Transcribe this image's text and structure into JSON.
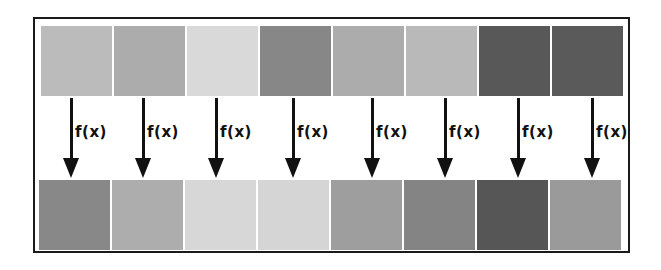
{
  "diagram": {
    "function_label": "f(x)",
    "input_squares": [
      {
        "index": 1,
        "color": "#c4c4c4"
      },
      {
        "index": 2,
        "color": "#b5b5b5"
      },
      {
        "index": 3,
        "color": "#e4e4e4"
      },
      {
        "index": 4,
        "color": "#8e8e8e"
      },
      {
        "index": 5,
        "color": "#b4b4b4"
      },
      {
        "index": 6,
        "color": "#c2c2c2"
      },
      {
        "index": 7,
        "color": "#5c5c5c"
      },
      {
        "index": 8,
        "color": "#5e5e5e"
      }
    ],
    "arrows": [
      {
        "index": 1,
        "label": "f(x)"
      },
      {
        "index": 2,
        "label": "f(x)"
      },
      {
        "index": 3,
        "label": "f(x)"
      },
      {
        "index": 4,
        "label": "f(x)"
      },
      {
        "index": 5,
        "label": "f(x)"
      },
      {
        "index": 6,
        "label": "f(x)"
      },
      {
        "index": 7,
        "label": "f(x)"
      },
      {
        "index": 8,
        "label": "f(x)"
      }
    ],
    "output_squares": [
      {
        "index": 1,
        "color": "#8f8f8f"
      },
      {
        "index": 2,
        "color": "#b6b6b6"
      },
      {
        "index": 3,
        "color": "#e2e2e2"
      },
      {
        "index": 4,
        "color": "#e0e0e0"
      },
      {
        "index": 5,
        "color": "#a6a6a6"
      },
      {
        "index": 6,
        "color": "#8a8a8a"
      },
      {
        "index": 7,
        "color": "#5a5a5a"
      },
      {
        "index": 8,
        "color": "#a2a2a2"
      }
    ],
    "colors": {
      "frame_border": "#1a1a1a",
      "arrow": "#111111",
      "background": "#ffffff"
    }
  }
}
